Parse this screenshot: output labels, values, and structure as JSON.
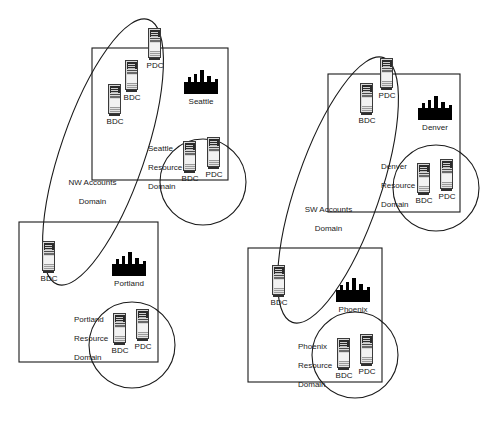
{
  "diagram": {
    "type": "network-domain-topology",
    "colors": {
      "line": "#1a1a1a",
      "text": "#1a1a1a",
      "skyline": "#000000",
      "background": "#ffffff"
    }
  },
  "accounts_domains": [
    {
      "id": "nw-accounts-domain",
      "label": "NW Accounts\nDomain",
      "label_line1": "NW Accounts",
      "label_line2": "Domain",
      "servers": [
        {
          "id": "nw-pdc",
          "role": "PDC"
        },
        {
          "id": "nw-bdc-1",
          "role": "BDC"
        },
        {
          "id": "nw-bdc-2",
          "role": "BDC"
        },
        {
          "id": "nw-bdc-3",
          "role": "BDC"
        }
      ]
    },
    {
      "id": "sw-accounts-domain",
      "label": "SW Accounts\nDomain",
      "label_line1": "SW Accounts",
      "label_line2": "Domain",
      "servers": [
        {
          "id": "sw-pdc",
          "role": "PDC"
        },
        {
          "id": "sw-bdc-1",
          "role": "BDC"
        },
        {
          "id": "sw-bdc-2",
          "role": "BDC"
        }
      ]
    }
  ],
  "sites": [
    {
      "id": "seattle",
      "city": "Seattle",
      "resource_domain": {
        "id": "seattle-resource-domain",
        "label_line1": "Seattle",
        "label_line2": "Resource",
        "label_line3": "Domain",
        "servers": [
          {
            "id": "seattle-bdc",
            "role": "BDC"
          },
          {
            "id": "seattle-pdc",
            "role": "PDC"
          }
        ]
      }
    },
    {
      "id": "portland",
      "city": "Portland",
      "resource_domain": {
        "id": "portland-resource-domain",
        "label_line1": "Portland",
        "label_line2": "Resource",
        "label_line3": "Domain",
        "servers": [
          {
            "id": "portland-bdc",
            "role": "BDC"
          },
          {
            "id": "portland-pdc",
            "role": "PDC"
          }
        ]
      }
    },
    {
      "id": "denver",
      "city": "Denver",
      "resource_domain": {
        "id": "denver-resource-domain",
        "label_line1": "Denver",
        "label_line2": "Resource",
        "label_line3": "Domain",
        "servers": [
          {
            "id": "denver-bdc",
            "role": "BDC"
          },
          {
            "id": "denver-pdc",
            "role": "PDC"
          }
        ]
      }
    },
    {
      "id": "phoenix",
      "city": "Phoenix",
      "resource_domain": {
        "id": "phoenix-resource-domain",
        "label_line1": "Phoenix",
        "label_line2": "Resource",
        "label_line3": "Domain",
        "servers": [
          {
            "id": "phoenix-bdc",
            "role": "BDC"
          },
          {
            "id": "phoenix-pdc",
            "role": "PDC"
          }
        ]
      }
    }
  ]
}
